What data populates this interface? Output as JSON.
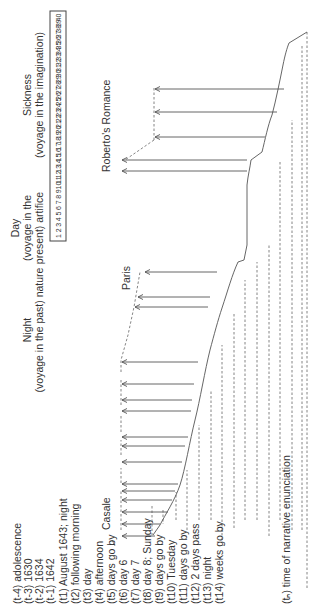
{
  "headers": {
    "night_title": "Night",
    "night_sub": "(voyage in the past) nature",
    "day_title": "Day",
    "day_sub1": "(voyage in the",
    "day_sub2": "present) artifice",
    "sickness_title": "Sickness",
    "sickness_sub": "(voyage in the imagination)"
  },
  "scale": {
    "numbers": [
      "1",
      "2",
      "3",
      "4",
      "5",
      "6",
      "7",
      "8",
      "9",
      "10",
      "11",
      "12",
      "13",
      "14",
      "15",
      "16",
      "17",
      "18",
      "19",
      "20",
      "21",
      "22",
      "23",
      "24",
      "25",
      "26",
      "27",
      "28",
      "29",
      "30",
      "31",
      "32",
      "33",
      "34",
      "35",
      "36",
      "37",
      "38",
      "39",
      "40"
    ]
  },
  "places": {
    "casale": "Casale",
    "paris": "Paris",
    "roberto": "Roberto's Romance"
  },
  "timeline": {
    "labels": [
      "(t-4) adolescence",
      "(t-3) 1630",
      "(t-2) 1634",
      "(t-1) 1642",
      "(t1) August 1643; night",
      "(t2) following morning",
      "(t3) day",
      "(t4) afternoon",
      "(t5) days go by",
      "(t6) day 6",
      "(t7) day 7",
      "(t8) day 8; Sunday",
      "(t9) days go by",
      "(t10) Tuesday",
      "(t11) days go by",
      "(t12) 2 days pass",
      "(t13) night",
      "(t14) weeks go by"
    ],
    "enunciation": "(tₙ) time of narrative enunciation"
  }
}
